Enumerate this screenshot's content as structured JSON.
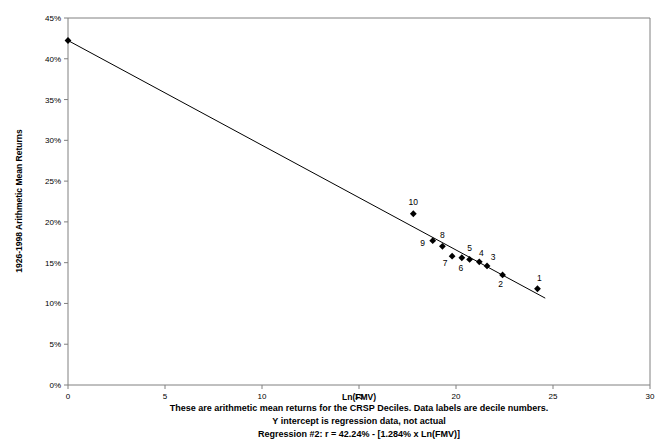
{
  "chart_data": {
    "type": "scatter",
    "title": "",
    "xlabel": "Ln(FMV)",
    "ylabel": "1926-1998 Arithmetic Mean Returns",
    "xlim": [
      0,
      30
    ],
    "ylim": [
      0,
      45
    ],
    "xticks": [
      "0",
      "5",
      "10",
      "15",
      "20",
      "25",
      "30"
    ],
    "xtick_values": [
      0,
      5,
      10,
      15,
      20,
      25,
      30
    ],
    "yticks": [
      "0%",
      "5%",
      "10%",
      "15%",
      "20%",
      "25%",
      "30%",
      "35%",
      "40%",
      "45%"
    ],
    "ytick_values": [
      0,
      5,
      10,
      15,
      20,
      25,
      30,
      35,
      40,
      45
    ],
    "grid": false,
    "legend": "none",
    "series": [
      {
        "name": "CRSP Decile arithmetic mean returns",
        "marker": "diamond",
        "color": "#000000",
        "points": [
          {
            "label": "10",
            "x": 17.8,
            "y": 21.0,
            "label_dx": 0,
            "label_dy": -9
          },
          {
            "label": "9",
            "x": 18.8,
            "y": 17.7,
            "label_dx": -10,
            "label_dy": 5
          },
          {
            "label": "8",
            "x": 19.3,
            "y": 17.0,
            "label_dx": 0,
            "label_dy": -8
          },
          {
            "label": "7",
            "x": 19.8,
            "y": 15.8,
            "label_dx": -7,
            "label_dy": 10
          },
          {
            "label": "6",
            "x": 20.3,
            "y": 15.6,
            "label_dx": -1,
            "label_dy": 13
          },
          {
            "label": "5",
            "x": 20.7,
            "y": 15.4,
            "label_dx": 0,
            "label_dy": -8
          },
          {
            "label": "4",
            "x": 21.2,
            "y": 15.1,
            "label_dx": 2,
            "label_dy": -6
          },
          {
            "label": "3",
            "x": 21.6,
            "y": 14.6,
            "label_dx": 6,
            "label_dy": -6
          },
          {
            "label": "2",
            "x": 22.4,
            "y": 13.5,
            "label_dx": -2,
            "label_dy": 12
          },
          {
            "label": "1",
            "x": 24.2,
            "y": 11.8,
            "label_dx": 2,
            "label_dy": -8
          }
        ]
      }
    ],
    "regression_line": {
      "name": "Regression #2",
      "intercept": 42.24,
      "slope": -1.284,
      "x_start": 0,
      "x_end": 24.6,
      "y_start": 42.24,
      "y_end": 10.65,
      "intercept_marker": true
    },
    "annotations": [
      "These are arithmetic mean returns for the CRSP Deciles.  Data labels are decile numbers.",
      "Y intercept is regression data, not actual",
      "Regression #2: r = 42.24% - [1.284% x Ln(FMV)]"
    ]
  }
}
